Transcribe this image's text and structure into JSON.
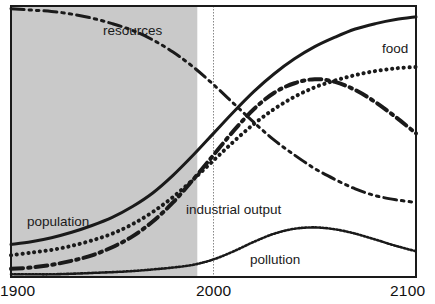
{
  "figure": {
    "title": "",
    "background_color": "#ffffff",
    "frame_color": "#1a1a1a",
    "shaded_region_color": "#c9c9c9",
    "marker_line_color": "#888888"
  },
  "axis": {
    "x_ticks": [
      "1900",
      "2000",
      "2100"
    ],
    "x_start_label": "1900",
    "x_mid_label": "2000",
    "x_end_label": "2100"
  },
  "labels": {
    "resources": "resources",
    "food": "food",
    "population": "population",
    "industrial_output": "industrial output",
    "pollution": "pollution"
  },
  "chart_data": {
    "type": "line",
    "title": "",
    "subtitle": "",
    "xlabel": "",
    "ylabel": "",
    "xlim": [
      1900,
      2100
    ],
    "ylim": [
      0,
      100
    ],
    "grid": false,
    "legend_position": "inline-annotations",
    "x_tick_labels": [
      "1900",
      "2000",
      "2100"
    ],
    "y_tick_labels": [],
    "annotations": [
      {
        "text": "resources",
        "x": 1950,
        "y": 90,
        "series": "resources"
      },
      {
        "text": "food",
        "x": 2088,
        "y": 79,
        "series": "food"
      },
      {
        "text": "population",
        "x": 1908,
        "y": 21,
        "series": "population"
      },
      {
        "text": "industrial output",
        "x": 1987,
        "y": 26,
        "series": "industrial_output"
      },
      {
        "text": "pollution",
        "x": 2019,
        "y": 8,
        "series": "pollution"
      }
    ],
    "shaded_region": {
      "x_from": 1900,
      "x_to": 1992,
      "label": "historical period",
      "color": "#c9c9c9"
    },
    "vertical_marker": {
      "x": 2000,
      "style": "dotted",
      "color": "#888888"
    },
    "x": [
      1900,
      1910,
      1920,
      1930,
      1940,
      1950,
      1960,
      1970,
      1980,
      1990,
      2000,
      2010,
      2020,
      2030,
      2040,
      2050,
      2060,
      2070,
      2080,
      2090,
      2100
    ],
    "series": [
      {
        "name": "resources",
        "line_style": "dash-dot-dot",
        "line_width": 3,
        "color": "#1a1a1a",
        "values": [
          99,
          98.5,
          98,
          97,
          95.5,
          93.5,
          91,
          87.5,
          83,
          77.5,
          71,
          64,
          57,
          50.5,
          45,
          40,
          36,
          32.5,
          30,
          28.5,
          27.5
        ]
      },
      {
        "name": "population",
        "line_style": "solid",
        "line_width": 3,
        "color": "#1a1a1a",
        "values": [
          12,
          13,
          14.5,
          16.5,
          19,
          22,
          26,
          31,
          37.5,
          45,
          53,
          61,
          68.5,
          75,
          80.5,
          85,
          88.5,
          91.5,
          93.5,
          95,
          96
        ]
      },
      {
        "name": "food",
        "line_style": "dotted",
        "line_width": 4,
        "color": "#1a1a1a",
        "values": [
          8,
          9,
          10,
          11.5,
          13.5,
          16,
          19.5,
          24,
          29.5,
          36,
          43,
          50,
          56.5,
          62,
          66.5,
          70,
          72.5,
          74.5,
          76,
          77,
          77.5
        ]
      },
      {
        "name": "industrial_output",
        "line_style": "dash-dot",
        "line_width": 4,
        "color": "#1a1a1a",
        "values": [
          3,
          3.5,
          4.5,
          6,
          8,
          11,
          15,
          20.5,
          27.5,
          36,
          45,
          54,
          62,
          68,
          71.5,
          73,
          72,
          69,
          64.5,
          59,
          53
        ]
      },
      {
        "name": "pollution",
        "line_style": "fine-dotted",
        "line_width": 2.5,
        "color": "#1a1a1a",
        "values": [
          1,
          1,
          1,
          1.2,
          1.5,
          1.8,
          2.2,
          2.8,
          3.5,
          4.5,
          6.5,
          9.5,
          13,
          16,
          17.8,
          18.3,
          17.6,
          16,
          13.8,
          11.5,
          9.5
        ]
      }
    ]
  }
}
